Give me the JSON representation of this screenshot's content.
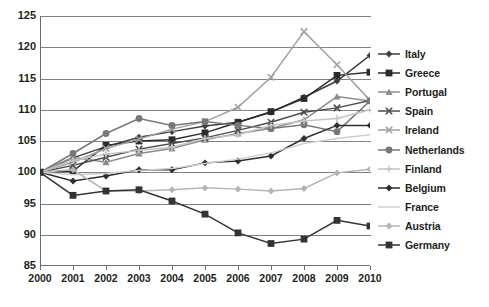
{
  "chart_data": {
    "type": "line",
    "title": "",
    "xlabel": "",
    "ylabel": "",
    "x": [
      2000,
      2001,
      2002,
      2003,
      2004,
      2005,
      2006,
      2007,
      2008,
      2009,
      2010
    ],
    "xtick_labels": [
      "2000",
      "2001",
      "2002",
      "2003",
      "2004",
      "2005",
      "2006",
      "2007",
      "2008",
      "2009",
      "2010"
    ],
    "ytick_labels": [
      "125",
      "120",
      "115",
      "110",
      "105",
      "100",
      "95",
      "90",
      "85"
    ],
    "ylim": [
      85,
      125
    ],
    "ytick_step": 5,
    "grid": "horizontal",
    "legend_position": "right",
    "series": [
      {
        "name": "Italy",
        "marker": "diamond",
        "color": "#3f3f3f",
        "values": [
          100,
          102.3,
          104.1,
          105.6,
          106.5,
          107.4,
          108.0,
          109.6,
          112.0,
          114.6,
          118.7
        ]
      },
      {
        "name": "Greece",
        "marker": "square",
        "color": "#2b2b2b",
        "values": [
          100,
          100.2,
          104.3,
          105.0,
          105.2,
          106.3,
          108.0,
          109.7,
          111.8,
          115.5,
          116.0
        ]
      },
      {
        "name": "Portugal",
        "marker": "triangle",
        "color": "#8d8d8d",
        "values": [
          100,
          102.4,
          101.6,
          103.0,
          103.8,
          105.2,
          106.2,
          107.0,
          108.4,
          112.1,
          111.4
        ]
      },
      {
        "name": "Spain",
        "marker": "cross",
        "color": "#4d4d4d",
        "values": [
          100,
          101.1,
          102.4,
          103.7,
          104.6,
          105.5,
          106.7,
          108.0,
          109.6,
          110.3,
          111.5
        ]
      },
      {
        "name": "Ireland",
        "marker": "cross",
        "color": "#a0a0a0",
        "values": [
          100,
          101.6,
          103.8,
          105.3,
          106.9,
          108.1,
          110.4,
          115.2,
          122.5,
          117.2,
          111.5
        ]
      },
      {
        "name": "Netherlands",
        "marker": "circle",
        "color": "#787878",
        "values": [
          100,
          103.0,
          106.2,
          108.6,
          107.5,
          108.1,
          107.5,
          107.0,
          107.6,
          106.5,
          111.4
        ]
      },
      {
        "name": "Finland",
        "marker": "plus",
        "color": "#c3c3c3",
        "values": [
          100,
          101.9,
          102.9,
          103.5,
          104.0,
          105.4,
          106.0,
          107.5,
          108.2,
          108.6,
          110.0
        ]
      },
      {
        "name": "Belgium",
        "marker": "diamond",
        "color": "#2f2f2f",
        "values": [
          100,
          98.6,
          99.4,
          100.4,
          100.4,
          101.5,
          101.8,
          102.6,
          105.4,
          107.5,
          107.5
        ]
      },
      {
        "name": "France",
        "marker": "line",
        "color": "#cfcfcf",
        "values": [
          100,
          99.6,
          99.8,
          100.3,
          100.6,
          101.4,
          102.1,
          103.1,
          104.6,
          105.4,
          106.0
        ]
      },
      {
        "name": "Austria",
        "marker": "diamond",
        "color": "#b4b4b4",
        "values": [
          100,
          100.4,
          97.0,
          97.0,
          97.2,
          97.5,
          97.3,
          97.0,
          97.4,
          99.9,
          100.5
        ]
      },
      {
        "name": "Germany",
        "marker": "square",
        "color": "#333333",
        "values": [
          100,
          96.3,
          97.0,
          97.2,
          95.4,
          93.3,
          90.3,
          88.6,
          89.3,
          92.3,
          91.4
        ]
      }
    ]
  }
}
